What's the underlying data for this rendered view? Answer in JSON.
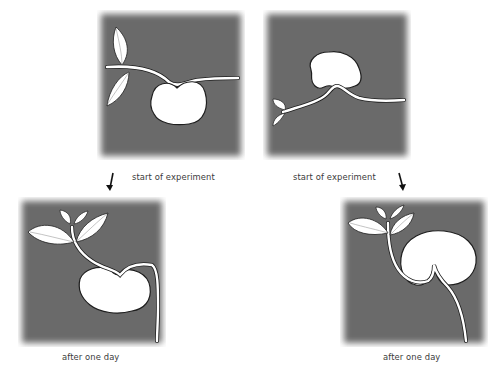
{
  "diagram": {
    "panels": [
      {
        "id": "start-left",
        "label": "start of experiment",
        "description": "seed lying horizontally, shoot and root extending sideways"
      },
      {
        "id": "start-right",
        "label": "start of experiment",
        "description": "seed rotated, shoot extending left, root extending right"
      },
      {
        "id": "day1-left",
        "label": "after one day",
        "description": "shoot bent upward with leaves, root bent downward"
      },
      {
        "id": "day1-right",
        "label": "after one day",
        "description": "shoot bent upward with leaves, root bent downward"
      }
    ],
    "arrows": [
      {
        "id": "arrow-left",
        "direction": "down-left",
        "from": "start-left",
        "to": "day1-left"
      },
      {
        "id": "arrow-right",
        "direction": "down-right",
        "from": "start-right",
        "to": "day1-right"
      }
    ],
    "colors": {
      "panel_background": "#6b6b6b",
      "plant_fill": "#ffffff",
      "plant_outline": "#1e1e1e",
      "caption_text": "#3a3a3a",
      "arrow": "#111111"
    }
  }
}
